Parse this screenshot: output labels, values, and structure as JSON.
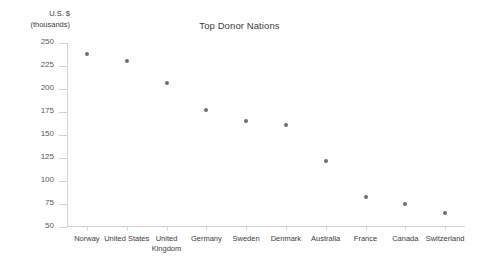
{
  "chart_data": {
    "type": "scatter",
    "title": "Top Donor Nations",
    "xlabel": "",
    "ylabel": "U.S. $ (thousands)",
    "ylabel_lines": [
      "U.S. $",
      "(thousands)"
    ],
    "categories": [
      "Norway",
      "United States",
      "United Kingdom",
      "Germany",
      "Sweden",
      "Denmark",
      "Australia",
      "France",
      "Canada",
      "Switzerland"
    ],
    "values": [
      238,
      230,
      206,
      177,
      165,
      161,
      122,
      83,
      75,
      65
    ],
    "ylim": [
      50,
      250
    ],
    "yticks": [
      250,
      225,
      200,
      175,
      150,
      125,
      100,
      75,
      50
    ],
    "grid": false,
    "legend": "none",
    "marker_color": "#6e6e72",
    "axis_color": "#d2d2d2",
    "background": "#ffffff"
  }
}
